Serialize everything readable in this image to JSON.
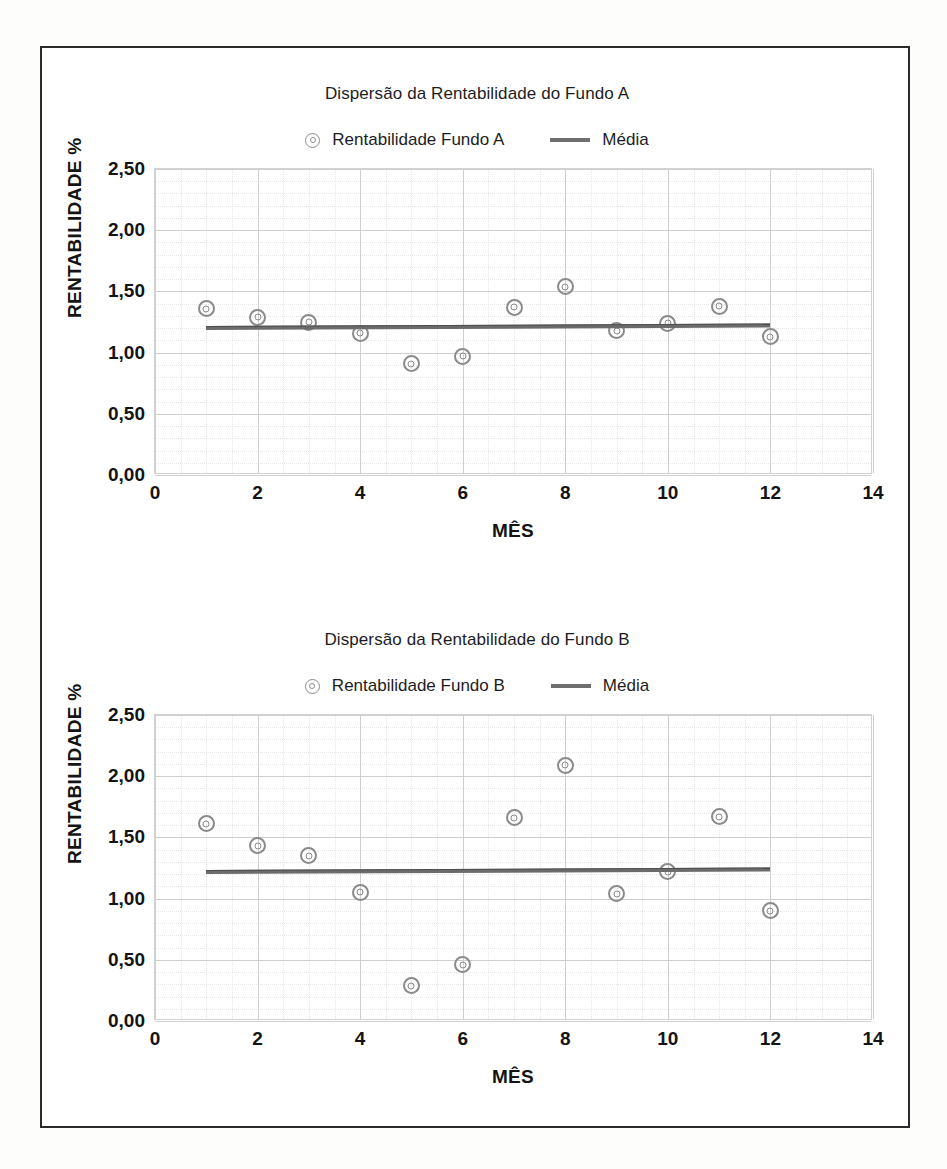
{
  "page": {
    "background_color": "#ffffff",
    "border_color": "#2b2b2b"
  },
  "charts": [
    {
      "title": "Dispersão da Rentabilidade do Fundo A",
      "legend": [
        {
          "label": "Rentabilidade Fundo A",
          "type": "marker",
          "color": "#8a8a8a"
        },
        {
          "label": "Média",
          "type": "line",
          "color": "#6b6b6b"
        }
      ],
      "xlabel": "MÊS",
      "ylabel": "RENTABILIDADE %",
      "yticks": [
        "0,00",
        "0,50",
        "1,00",
        "1,50",
        "2,00",
        "2,50"
      ],
      "xticks": [
        "0",
        "2",
        "4",
        "6",
        "8",
        "10",
        "12",
        "14"
      ]
    },
    {
      "title": "Dispersão da Rentabilidade do Fundo B",
      "legend": [
        {
          "label": "Rentabilidade Fundo B",
          "type": "marker",
          "color": "#8a8a8a"
        },
        {
          "label": "Média",
          "type": "line",
          "color": "#6b6b6b"
        }
      ],
      "xlabel": "MÊS",
      "ylabel": "RENTABILIDADE %",
      "yticks": [
        "0,00",
        "0,50",
        "1,00",
        "1,50",
        "2,00",
        "2,50"
      ],
      "xticks": [
        "0",
        "2",
        "4",
        "6",
        "8",
        "10",
        "12",
        "14"
      ]
    }
  ],
  "chart_data": [
    {
      "type": "scatter",
      "title": "Dispersão da Rentabilidade do Fundo A",
      "xlabel": "MÊS",
      "ylabel": "RENTABILIDADE %",
      "xlim": [
        0,
        14
      ],
      "ylim": [
        0.0,
        2.5
      ],
      "xticks": [
        0,
        2,
        4,
        6,
        8,
        10,
        12,
        14
      ],
      "yticks": [
        0.0,
        0.5,
        1.0,
        1.5,
        2.0,
        2.5
      ],
      "grid": true,
      "legend_position": "top",
      "series": [
        {
          "name": "Rentabilidade Fundo A",
          "type": "scatter",
          "x": [
            1,
            2,
            3,
            4,
            5,
            6,
            7,
            8,
            9,
            10,
            11,
            12
          ],
          "values": [
            1.36,
            1.29,
            1.25,
            1.16,
            0.91,
            0.97,
            1.37,
            1.54,
            1.18,
            1.24,
            1.38,
            1.13
          ]
        },
        {
          "name": "Média",
          "type": "line",
          "x": [
            1,
            12
          ],
          "values": [
            1.22,
            1.24
          ]
        }
      ]
    },
    {
      "type": "scatter",
      "title": "Dispersão da Rentabilidade do Fundo B",
      "xlabel": "MÊS",
      "ylabel": "RENTABILIDADE %",
      "xlim": [
        0,
        14
      ],
      "ylim": [
        0.0,
        2.5
      ],
      "xticks": [
        0,
        2,
        4,
        6,
        8,
        10,
        12,
        14
      ],
      "yticks": [
        0.0,
        0.5,
        1.0,
        1.5,
        2.0,
        2.5
      ],
      "grid": true,
      "legend_position": "top",
      "series": [
        {
          "name": "Rentabilidade Fundo B",
          "type": "scatter",
          "x": [
            1,
            2,
            3,
            4,
            5,
            6,
            7,
            8,
            9,
            10,
            11,
            12
          ],
          "values": [
            1.61,
            1.43,
            1.35,
            1.05,
            0.29,
            0.46,
            1.66,
            2.09,
            1.04,
            1.22,
            1.67,
            0.9
          ]
        },
        {
          "name": "Média",
          "type": "line",
          "x": [
            1,
            12
          ],
          "values": [
            1.23,
            1.25
          ]
        }
      ]
    }
  ]
}
